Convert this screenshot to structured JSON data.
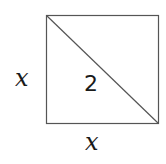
{
  "diagram": {
    "type": "square-with-diagonal",
    "shape": {
      "x": 46.5,
      "y": 15.5,
      "width": 112,
      "height": 108,
      "stroke": "#555555",
      "stroke_width": 1.2,
      "fill": "#ffffff"
    },
    "diagonal": {
      "x1": 46.5,
      "y1": 15.5,
      "x2": 158.5,
      "y2": 123.5,
      "stroke": "#555555"
    },
    "labels": {
      "left_side": "x",
      "bottom_side": "x",
      "diagonal": "2"
    }
  }
}
